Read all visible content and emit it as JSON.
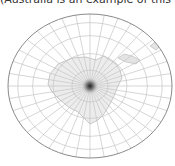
{
  "caption": "(Australia is an example of this projection.)",
  "map": {
    "projection": "azimuthal",
    "center": {
      "x": 90,
      "y": 86
    },
    "boundary": {
      "rx": 82,
      "ry": 72
    },
    "parallel_count": 4,
    "meridian_count": 36,
    "colors": {
      "grid": "#c4c4c4",
      "boundary": "#8a8a8a",
      "land_fill": "#ececec",
      "land_stroke": "#a8a8a8",
      "center_dot": "#333333"
    }
  }
}
